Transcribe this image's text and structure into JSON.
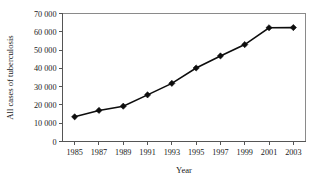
{
  "chart_data": {
    "type": "line",
    "title": "",
    "xlabel": "Year",
    "ylabel": "All cases of tuberculosis",
    "x": [
      1985,
      1987,
      1989,
      1991,
      1993,
      1995,
      1997,
      1999,
      2001,
      2003
    ],
    "values": [
      13500,
      17000,
      19300,
      25500,
      31800,
      40200,
      46800,
      53000,
      62200,
      62300
    ],
    "series": [
      {
        "name": "All cases of tuberculosis",
        "values": [
          13500,
          17000,
          19300,
          25500,
          31800,
          40200,
          46800,
          53000,
          62200,
          62300
        ]
      }
    ],
    "categories": [
      "1985",
      "1987",
      "1989",
      "1991",
      "1993",
      "1995",
      "1997",
      "1999",
      "2001",
      "2003"
    ],
    "xtick_labels": [
      "1985",
      "1987",
      "1989",
      "1991",
      "1993",
      "1995",
      "1997",
      "1999",
      "2001",
      "2003"
    ],
    "ytick_labels": [
      "0",
      "10 000",
      "20 000",
      "30 000",
      "40 000",
      "50 000",
      "60 000",
      "70 000"
    ],
    "ytick_values": [
      0,
      10000,
      20000,
      30000,
      40000,
      50000,
      60000,
      70000
    ],
    "xlim": [
      1984,
      2004
    ],
    "ylim": [
      0,
      70000
    ],
    "grid": false,
    "legend": null,
    "marker": "diamond",
    "line_color": "#0d0d0d",
    "marker_color": "#0d0d0d",
    "background_color": "#ffffff"
  }
}
